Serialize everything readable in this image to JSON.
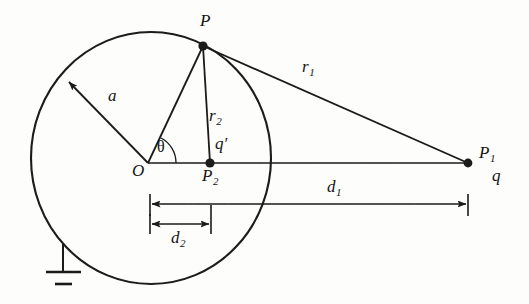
{
  "figure": {
    "background_color": "#fdfdfc",
    "stroke_color": "#1a1a1a"
  },
  "labels": {
    "point_P": "P",
    "point_O": "O",
    "point_P1": "P",
    "point_P1_sub": "1",
    "point_P2": "P",
    "point_P2_sub": "2",
    "charge_q": "q",
    "image_charge_q_prime": "q′",
    "radius_a": "a",
    "distance_r1": "r",
    "distance_r1_sub": "1",
    "distance_r2": "r",
    "distance_r2_sub": "2",
    "distance_d1": "d",
    "distance_d1_sub": "1",
    "distance_d2": "d",
    "distance_d2_sub": "2",
    "angle_theta": "θ"
  },
  "geometry": {
    "sphere": {
      "center_x": 151,
      "center_y": 158,
      "radius_x": 120,
      "radius_y": 126
    },
    "points": {
      "O": {
        "x": 148,
        "y": 163
      },
      "P": {
        "x": 203,
        "y": 46
      },
      "P1": {
        "x": 468,
        "y": 163
      },
      "P2": {
        "x": 210,
        "y": 163
      }
    },
    "radius_arrow": {
      "from_x": 148,
      "from_y": 163,
      "to_x": 68,
      "to_y": 81
    },
    "dimension_d1": {
      "x1": 150,
      "x2": 468,
      "y": 204
    },
    "dimension_d2": {
      "x1": 150,
      "x2": 211,
      "y": 224
    },
    "ground_symbol": {
      "x": 63,
      "top_y": 245,
      "stem_bottom_y": 271
    }
  },
  "label_positions": {
    "P": {
      "x": 200,
      "y": 20
    },
    "O": {
      "x": 134,
      "y": 163
    },
    "P1": {
      "x": 481,
      "y": 146
    },
    "q": {
      "x": 493,
      "y": 168
    },
    "P2": {
      "x": 203,
      "y": 168
    },
    "q_prime": {
      "x": 216,
      "y": 138
    },
    "a": {
      "x": 110,
      "y": 92
    },
    "r1": {
      "x": 303,
      "y": 61
    },
    "r2": {
      "x": 210,
      "y": 110
    },
    "d1": {
      "x": 328,
      "y": 181
    },
    "d2": {
      "x": 173,
      "y": 231
    },
    "theta": {
      "x": 159,
      "y": 141
    }
  }
}
